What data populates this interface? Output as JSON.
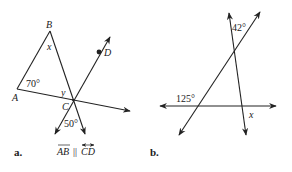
{
  "figure_a": {
    "caption": "a.",
    "points": {
      "A": "A",
      "B": "B",
      "C": "C",
      "D": "D"
    },
    "angle_A": "70°",
    "angle_B": "x",
    "angle_C_upper": "y",
    "angle_C_lower": "50°",
    "parallel_note": {
      "seg1": "AB",
      "sym": "||",
      "seg2": "CD"
    }
  },
  "figure_b": {
    "caption": "b.",
    "angle_top": "42°",
    "angle_left": "125°",
    "angle_right": "x"
  },
  "colors": {
    "ink": "#222222",
    "background": "#ffffff"
  }
}
